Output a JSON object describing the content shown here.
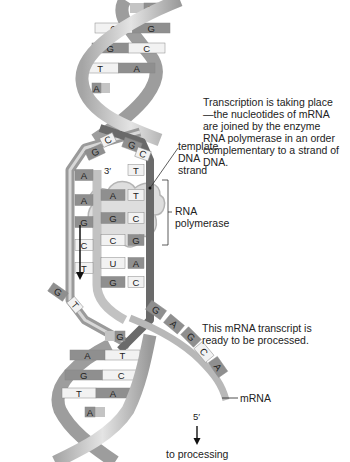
{
  "labels": {
    "template": "template\nDNA\nstrand",
    "transcription": "Transcription is taking place—the nucleotides of mRNA are joined by the enzyme RNA polymerase in an order complementary to a strand of DNA.",
    "polymerase": "RNA\npolymerase",
    "transcript": "This mRNA transcript is ready to be processed.",
    "mrna": "mRNA",
    "prime3": "3′",
    "prime5": "5′",
    "processing": "to processing"
  },
  "top_helix_pairs": [
    {
      "left": "",
      "right": "G"
    },
    {
      "left": "C",
      "right": "G"
    },
    {
      "left": "G",
      "right": "C"
    },
    {
      "left": "T",
      "right": "A"
    },
    {
      "left": "A",
      "right": ""
    }
  ],
  "bubble_top": {
    "left": [
      "G",
      "C"
    ],
    "right": [
      "G",
      "C"
    ]
  },
  "coding_strand_bases": [
    "A",
    "A",
    "G",
    "C",
    "T"
  ],
  "template_strand_pairs": [
    {
      "rna": "",
      "dna": "T"
    },
    {
      "rna": "A",
      "dna": "T"
    },
    {
      "rna": "G",
      "dna": "C"
    },
    {
      "rna": "C",
      "dna": "G"
    },
    {
      "rna": "U",
      "dna": "A"
    },
    {
      "rna": "G",
      "dna": "C"
    }
  ],
  "bubble_bottom_left": [
    "G",
    "T"
  ],
  "bottom_helix_pairs": [
    {
      "left": "",
      "right": "G"
    },
    {
      "left": "A",
      "right": "T"
    },
    {
      "left": "G",
      "right": "C"
    },
    {
      "left": "T",
      "right": "A"
    },
    {
      "left": "A",
      "right": ""
    }
  ],
  "mrna_strand_bases": [
    "G",
    "A",
    "G",
    "C",
    "A"
  ],
  "colors": {
    "backbone_light": "#c8c8c8",
    "backbone_dark": "#8a8a8a",
    "template_backbone": "#6e6e6e",
    "purine": "#8f8f8f",
    "pyrimidine": "#f2f2f2",
    "rna_strand": "#b5b5b5",
    "polymerase": "#d4d4d4"
  }
}
